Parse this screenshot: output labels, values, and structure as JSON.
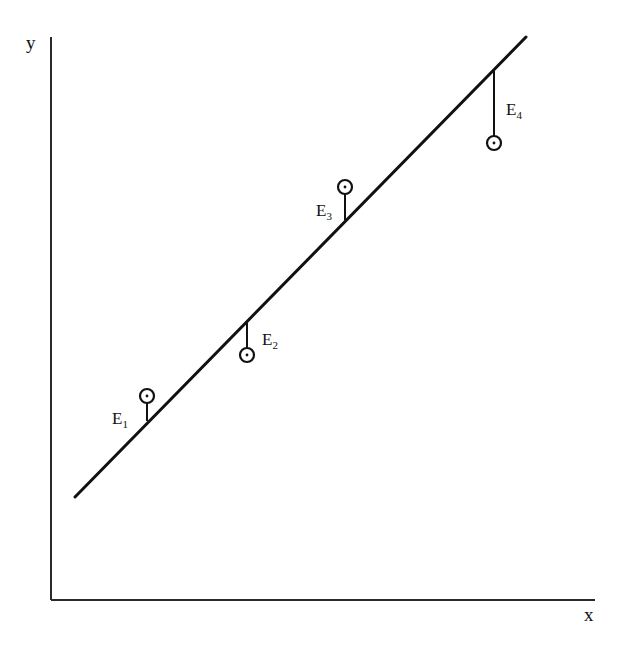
{
  "figure": {
    "type": "regression-residuals-diagram",
    "axes": {
      "x_label": "x",
      "y_label": "y"
    },
    "regression_line": {
      "label": "fitted line",
      "from": {
        "x": 75,
        "y": 497
      },
      "to": {
        "x": 526,
        "y": 37
      }
    },
    "residuals": [
      {
        "label": "E",
        "sub": "1",
        "point": {
          "x": 147,
          "y": 396
        },
        "line_y": 421,
        "direction": "above",
        "label_pos": {
          "x": 112,
          "y": 424
        }
      },
      {
        "label": "E",
        "sub": "2",
        "point": {
          "x": 247,
          "y": 355
        },
        "line_y": 323,
        "direction": "below",
        "label_pos": {
          "x": 262,
          "y": 345
        }
      },
      {
        "label": "E",
        "sub": "3",
        "point": {
          "x": 345,
          "y": 187
        },
        "line_y": 220,
        "direction": "above",
        "label_pos": {
          "x": 316,
          "y": 216
        }
      },
      {
        "label": "E",
        "sub": "4",
        "point": {
          "x": 494,
          "y": 143
        },
        "line_y": 69,
        "direction": "below",
        "label_pos": {
          "x": 506,
          "y": 115
        }
      }
    ]
  }
}
